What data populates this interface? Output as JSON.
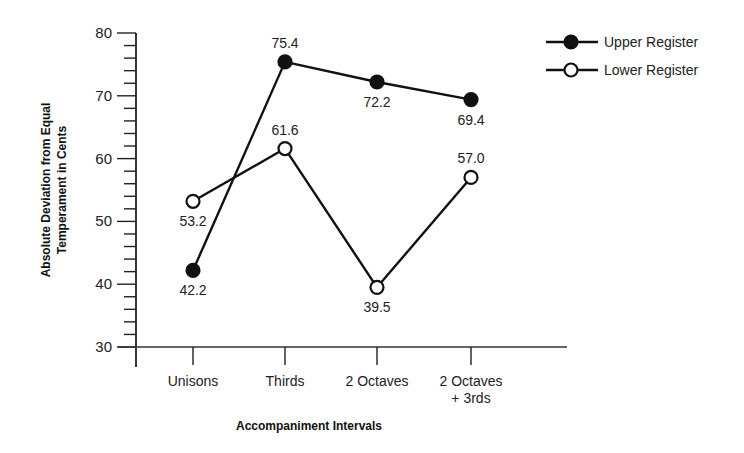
{
  "chart_data": {
    "type": "line",
    "title": "",
    "xlabel": "Accompaniment Intervals",
    "ylabel": "Absolute Deviation from Equal Temperament in Cents",
    "ylabel_lines": [
      "Absolute Deviation from Equal",
      "Temperament in Cents"
    ],
    "categories": [
      "Unisons",
      "Thirds",
      "2 Octaves",
      "2 Octaves + 3rds"
    ],
    "category_label_lines": [
      [
        "Unisons"
      ],
      [
        "Thirds"
      ],
      [
        "2 Octaves"
      ],
      [
        "2 Octaves",
        "+ 3rds"
      ]
    ],
    "ylim": [
      30,
      80
    ],
    "yticks": [
      30,
      40,
      50,
      60,
      70,
      80
    ],
    "minor_tick_step": 2,
    "grid": false,
    "legend_position": "top-right",
    "series": [
      {
        "name": "Upper Register",
        "marker": "filled-circle",
        "color": "#111111",
        "values": [
          42.2,
          75.4,
          72.2,
          69.4
        ],
        "labels": [
          "42.2",
          "75.4",
          "72.2",
          "69.4"
        ],
        "label_positions": [
          "below",
          "above",
          "below",
          "below"
        ]
      },
      {
        "name": "Lower Register",
        "marker": "open-circle",
        "color": "#111111",
        "values": [
          53.2,
          61.6,
          39.5,
          57.0
        ],
        "labels": [
          "53.2",
          "61.6",
          "39.5",
          "57.0"
        ],
        "label_positions": [
          "below",
          "above",
          "below",
          "above"
        ]
      }
    ]
  }
}
